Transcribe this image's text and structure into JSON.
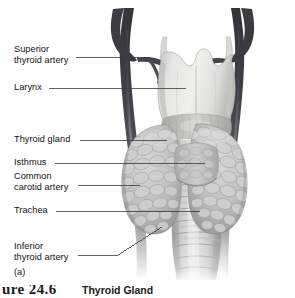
{
  "figure": {
    "panel_letter": "(a)",
    "caption_number": "ure 24.6",
    "caption_title": "Thyroid Gland",
    "alt": "Anterior view of the thyroid gland, larynx, trachea and common carotid arteries"
  },
  "labels": [
    {
      "id": "superior-thyroid-artery",
      "text": "Superior\nthyroid artery",
      "x": 14,
      "y": 44,
      "leader": {
        "x1": 76,
        "y1": 57,
        "x2": 150,
        "y2": 57
      }
    },
    {
      "id": "larynx",
      "text": "Larynx",
      "x": 14,
      "y": 82,
      "leader": {
        "x1": 49,
        "y1": 88,
        "x2": 186,
        "y2": 88
      }
    },
    {
      "id": "thyroid-gland",
      "text": "Thyroid gland",
      "x": 14,
      "y": 134,
      "leader": {
        "x1": 80,
        "y1": 140,
        "x2": 167,
        "y2": 141
      }
    },
    {
      "id": "isthmus",
      "text": "Isthmus",
      "x": 14,
      "y": 157,
      "leader": {
        "x1": 55,
        "y1": 163,
        "x2": 205,
        "y2": 164
      }
    },
    {
      "id": "common-carotid-artery",
      "text": "Common\ncarotid artery",
      "x": 14,
      "y": 171,
      "leader": {
        "x1": 78,
        "y1": 185,
        "x2": 140,
        "y2": 186
      }
    },
    {
      "id": "trachea",
      "text": "Trachea",
      "x": 14,
      "y": 205,
      "leader": {
        "x1": 56,
        "y1": 211,
        "x2": 200,
        "y2": 211
      }
    },
    {
      "id": "inferior-thyroid-artery",
      "text": "Inferior\nthyroid artery",
      "x": 14,
      "y": 241,
      "leader": {
        "x1": 78,
        "y1": 255,
        "x2": 118,
        "y2": 255
      },
      "leader2": {
        "x1": 118,
        "y1": 255,
        "x2": 162,
        "y2": 227
      }
    }
  ],
  "colors": {
    "background": "#ffffff",
    "leader_line": "#3a3a3a",
    "label_text": "#111111",
    "artery_dark": "#3f3f42",
    "artery_mid": "#5c5c60",
    "artery_light": "#8e8e92",
    "gland_light": "#d6d6d6",
    "gland_mid": "#b4b4b4",
    "gland_shadow": "#8f8f8f",
    "larynx_light": "#e4e4e2",
    "larynx_mid": "#cfcfcc",
    "trachea_light": "#dcdcdc",
    "trachea_ring": "#a8a8a8"
  }
}
